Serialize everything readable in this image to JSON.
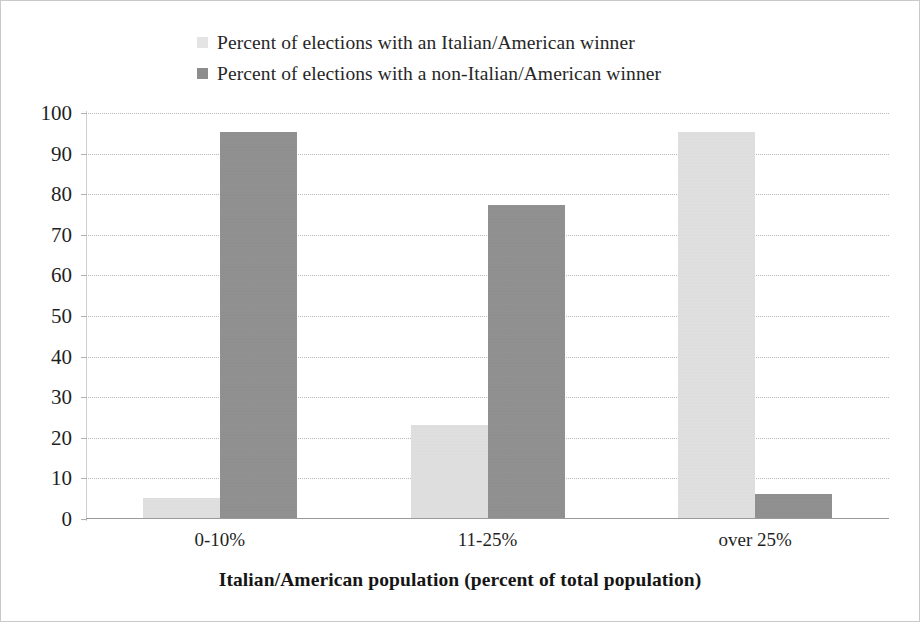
{
  "chart_data": {
    "type": "bar",
    "title": "",
    "subtitle": "",
    "xlabel": "Italian/American population (percent of total population)",
    "ylabel": "",
    "categories": [
      "0-10%",
      "11-25%",
      "over 25%"
    ],
    "series": [
      {
        "name": "Percent of elections with an Italian/American winner",
        "color": "#e3e3e3",
        "values": [
          5,
          23,
          95
        ]
      },
      {
        "name": "Percent of elections with a non-Italian/American winner",
        "color": "#8c8c8c",
        "values": [
          95,
          77,
          6
        ]
      }
    ],
    "ylim": [
      0,
      100
    ],
    "ytick_step": 10,
    "yticks": [
      100,
      90,
      80,
      70,
      60,
      50,
      40,
      30,
      20,
      10,
      0
    ],
    "grid": true,
    "grid_style": "dotted-horizontal",
    "legend_position": "top-center",
    "bar_group_mode": "clustered"
  },
  "legend": {
    "entries": [
      {
        "label": "Percent of elections with an Italian/American winner",
        "swatch": "light"
      },
      {
        "label": "Percent of elections with a non-Italian/American winner",
        "swatch": "dark"
      }
    ]
  },
  "axes": {
    "x_title": "Italian/American population (percent of total population)"
  }
}
